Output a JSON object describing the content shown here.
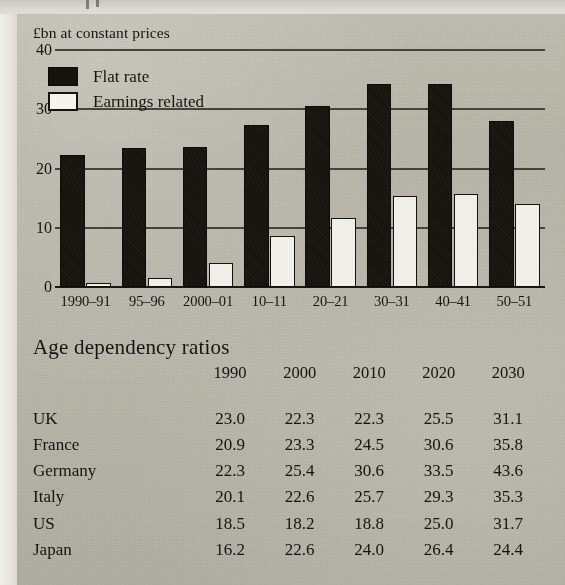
{
  "page": {
    "background_color": "#d9d7d0",
    "ink_color": "#16140f",
    "media": "scanned-print-page"
  },
  "chart_data": {
    "type": "bar",
    "title": "",
    "subtitle": "",
    "xlabel": "",
    "ylabel": "£bn at constant prices",
    "unit_label": "£bn at constant prices",
    "categories": [
      "1990–91",
      "95–96",
      "2000–01",
      "10–11",
      "20–21",
      "30–31",
      "40–41",
      "50–51"
    ],
    "series": [
      {
        "name": "Flat rate",
        "color": "#16130e",
        "style": "solid-black",
        "values": [
          22.2,
          23.5,
          23.6,
          27.3,
          30.6,
          34.2,
          34.2,
          28.0
        ]
      },
      {
        "name": "Earnings related",
        "color": "#f2f1ec",
        "style": "white-outlined",
        "values": [
          0.7,
          1.5,
          4.0,
          8.6,
          11.7,
          15.4,
          15.7,
          14.0
        ]
      }
    ],
    "grouping": "grouped",
    "ylim": [
      0,
      40
    ],
    "yticks": [
      0,
      10,
      20,
      30,
      40
    ],
    "ytick_labels": [
      "0",
      "10",
      "20",
      "30",
      "40"
    ],
    "grid": "horizontal",
    "legend_position": "top-left",
    "legend_entries": [
      "Flat rate",
      "Earnings related"
    ]
  },
  "table": {
    "title": "Age dependency ratios",
    "row_header_label": "",
    "columns": [
      "1990",
      "2000",
      "2010",
      "2020",
      "2030"
    ],
    "rows": [
      {
        "label": "UK",
        "values": [
          "23.0",
          "22.3",
          "22.3",
          "25.5",
          "31.1"
        ]
      },
      {
        "label": "France",
        "values": [
          "20.9",
          "23.3",
          "24.5",
          "30.6",
          "35.8"
        ]
      },
      {
        "label": "Germany",
        "values": [
          "22.3",
          "25.4",
          "30.6",
          "33.5",
          "43.6"
        ]
      },
      {
        "label": "Italy",
        "values": [
          "20.1",
          "22.6",
          "25.7",
          "29.3",
          "35.3"
        ]
      },
      {
        "label": "US",
        "values": [
          "18.5",
          "18.2",
          "18.8",
          "25.0",
          "31.7"
        ]
      },
      {
        "label": "Japan",
        "values": [
          "16.2",
          "22.6",
          "24.0",
          "26.4",
          "24.4"
        ]
      }
    ]
  }
}
